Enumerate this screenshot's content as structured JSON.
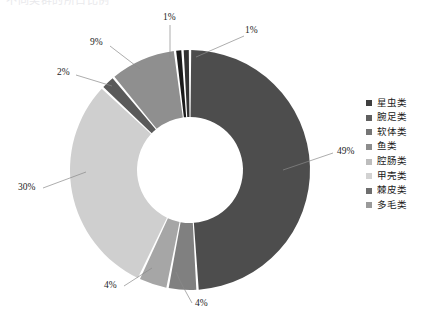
{
  "title_partial": "不同类群的所占比例",
  "chart_data": {
    "type": "pie",
    "variant": "donut",
    "title": "",
    "categories": [
      "星虫类",
      "腕足类",
      "软体类",
      "鱼类",
      "腔肠类",
      "甲壳类",
      "棘皮类",
      "多毛类"
    ],
    "values": [
      49,
      4,
      4,
      30,
      2,
      9,
      1,
      1
    ],
    "labels": [
      "49%",
      "4%",
      "4%",
      "30%",
      "2%",
      "9%",
      "1%",
      "1%"
    ],
    "colors": [
      "#4d4d4d",
      "#808080",
      "#a6a6a6",
      "#cfcfcf",
      "#5a5a5a",
      "#8f8f8f",
      "#1a1a1a",
      "#333333"
    ],
    "units": "%",
    "legend_position": "right",
    "grid": false,
    "slices": [
      {
        "name": "星虫类",
        "value": 49,
        "label": "49%",
        "color": "#4d4d4d"
      },
      {
        "name": "腕足类",
        "value": 4,
        "label": "4%",
        "color": "#808080"
      },
      {
        "name": "软体类",
        "value": 4,
        "label": "4%",
        "color": "#a6a6a6"
      },
      {
        "name": "鱼类",
        "value": 30,
        "label": "30%",
        "color": "#cfcfcf"
      },
      {
        "name": "腔肠类",
        "value": 2,
        "label": "2%",
        "color": "#5a5a5a"
      },
      {
        "name": "甲壳类",
        "value": 9,
        "label": "9%",
        "color": "#8f8f8f"
      },
      {
        "name": "棘皮类",
        "value": 1,
        "label": "1%",
        "color": "#1a1a1a"
      },
      {
        "name": "多毛类",
        "value": 1,
        "label": "1%",
        "color": "#333333"
      }
    ]
  },
  "callouts": [
    {
      "id": "callout-1pct-left",
      "text": "1%"
    },
    {
      "id": "callout-1pct-right",
      "text": "1%"
    },
    {
      "id": "callout-9pct",
      "text": "9%"
    },
    {
      "id": "callout-2pct",
      "text": "2%"
    },
    {
      "id": "callout-30pct",
      "text": "30%"
    },
    {
      "id": "callout-49pct",
      "text": "49%"
    },
    {
      "id": "callout-4pct-left",
      "text": "4%"
    },
    {
      "id": "callout-4pct-right",
      "text": "4%"
    }
  ],
  "legend": {
    "items": [
      {
        "label": "星虫类",
        "color": "#3f3f3f"
      },
      {
        "label": "腕足类",
        "color": "#5f5f5f"
      },
      {
        "label": "软体类",
        "color": "#757575"
      },
      {
        "label": "鱼类",
        "color": "#8d8d8d"
      },
      {
        "label": "腔肠类",
        "color": "#bdbdbd"
      },
      {
        "label": "甲壳类",
        "color": "#d2d2d2"
      },
      {
        "label": "棘皮类",
        "color": "#6e6e6e"
      },
      {
        "label": "多毛类",
        "color": "#9a9a9a"
      }
    ]
  }
}
